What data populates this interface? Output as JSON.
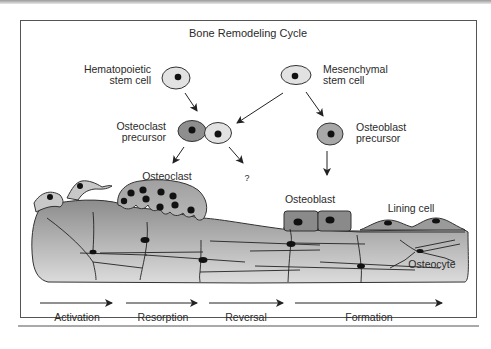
{
  "figure": {
    "title": "Bone Remodeling Cycle",
    "cells": {
      "hematopoietic_stem_cell": {
        "line1": "Hematopoietic",
        "line2": "stem cell"
      },
      "mesenchymal_stem_cell": {
        "line1": "Mesenchymal",
        "line2": "stem cell"
      },
      "osteoclast_precursor": {
        "line1": "Osteoclast",
        "line2": "precursor"
      },
      "osteoblast_precursor": {
        "line1": "Osteoblast",
        "line2": "precursor"
      },
      "osteoclast": "Osteoclast",
      "unknown_fate": "?",
      "osteoblast": "Osteoblast",
      "lining_cell": "Lining cell",
      "osteocyte": "Osteocyte"
    },
    "phases": [
      "Activation",
      "Resorption",
      "Reversal",
      "Formation"
    ],
    "colors": {
      "frame": "#555555",
      "cell_light": "#e2e2e2",
      "cell_dark": "#8e8e8e",
      "cell_medium": "#a8a8a8",
      "bone_top": "#8a8a8a",
      "bone_bottom": "#d8d8d8",
      "nucleus": "#111111"
    }
  }
}
